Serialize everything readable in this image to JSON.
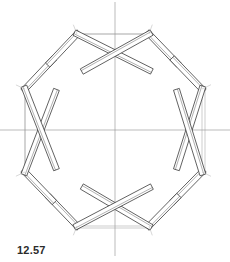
{
  "figure": {
    "label": "12.57"
  },
  "colors": {
    "ink": "#3a3a3a",
    "construction_line": "#9a9a9a",
    "background": "#ffffff"
  },
  "axes": {
    "vertical": {
      "x": 115,
      "y1": 2,
      "y2": 256
    },
    "horizontal": {
      "y": 130,
      "x1": 0,
      "x2": 230
    }
  },
  "nodes": [
    {
      "id": "n1",
      "x": 77,
      "y": 34
    },
    {
      "id": "n2",
      "x": 149,
      "y": 34
    },
    {
      "id": "n3",
      "x": 202,
      "y": 89
    },
    {
      "id": "n4",
      "x": 202,
      "y": 172
    },
    {
      "id": "n5",
      "x": 149,
      "y": 226
    },
    {
      "id": "n6",
      "x": 77,
      "y": 226
    },
    {
      "id": "n7",
      "x": 25,
      "y": 172
    },
    {
      "id": "n8",
      "x": 25,
      "y": 89
    }
  ],
  "crossings": [
    {
      "id": "top",
      "x": 115,
      "y": 53
    },
    {
      "id": "right",
      "x": 189,
      "y": 130
    },
    {
      "id": "bottom",
      "x": 115,
      "y": 206
    },
    {
      "id": "left",
      "x": 41,
      "y": 130
    }
  ],
  "short_members": [
    {
      "from": "n1",
      "to": "i1"
    },
    {
      "from": "n2",
      "to": "i2"
    }
  ]
}
